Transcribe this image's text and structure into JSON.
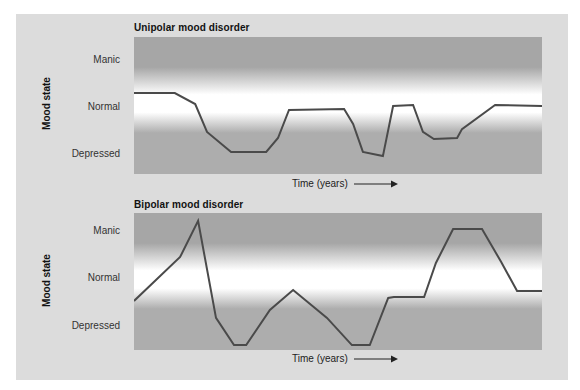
{
  "chart_data": [
    {
      "type": "line",
      "title": "Unipolar mood disorder",
      "xlabel": "Time (years)",
      "ylabel": "Mood state",
      "y_categories": [
        "Manic",
        "Normal",
        "Depressed"
      ],
      "legend": null,
      "grid": false,
      "note": "Schematic mood trace; y values normalized 0 (bottom of plot/Depressed band) to 1 (top of plot/Manic band); x normalized 0-1 across time axis",
      "series": [
        {
          "name": "Mood",
          "points": [
            [
              0.0,
              0.591
            ],
            [
              0.1,
              0.591
            ],
            [
              0.15,
              0.511
            ],
            [
              0.179,
              0.307
            ],
            [
              0.238,
              0.161
            ],
            [
              0.324,
              0.161
            ],
            [
              0.353,
              0.263
            ],
            [
              0.38,
              0.467
            ],
            [
              0.515,
              0.474
            ],
            [
              0.537,
              0.365
            ],
            [
              0.561,
              0.161
            ],
            [
              0.61,
              0.131
            ],
            [
              0.635,
              0.496
            ],
            [
              0.684,
              0.504
            ],
            [
              0.708,
              0.307
            ],
            [
              0.735,
              0.255
            ],
            [
              0.792,
              0.263
            ],
            [
              0.804,
              0.328
            ],
            [
              0.885,
              0.504
            ],
            [
              1.0,
              0.496
            ]
          ]
        }
      ]
    },
    {
      "type": "line",
      "title": "Bipolar mood disorder",
      "xlabel": "Time (years)",
      "ylabel": "Mood state",
      "y_categories": [
        "Manic",
        "Normal",
        "Depressed"
      ],
      "legend": null,
      "grid": false,
      "note": "Schematic mood trace; y values normalized 0 (bottom) to 1 (top); x normalized 0-1",
      "series": [
        {
          "name": "Mood",
          "points": [
            [
              0.0,
              0.358
            ],
            [
              0.113,
              0.679
            ],
            [
              0.157,
              0.942
            ],
            [
              0.201,
              0.234
            ],
            [
              0.245,
              0.036
            ],
            [
              0.275,
              0.036
            ],
            [
              0.333,
              0.292
            ],
            [
              0.39,
              0.438
            ],
            [
              0.473,
              0.234
            ],
            [
              0.534,
              0.036
            ],
            [
              0.578,
              0.036
            ],
            [
              0.623,
              0.38
            ],
            [
              0.637,
              0.387
            ],
            [
              0.711,
              0.387
            ],
            [
              0.74,
              0.635
            ],
            [
              0.782,
              0.883
            ],
            [
              0.853,
              0.883
            ],
            [
              0.9,
              0.642
            ],
            [
              0.939,
              0.431
            ],
            [
              1.0,
              0.431
            ]
          ]
        }
      ]
    }
  ],
  "charts": {
    "unipolar": {
      "title": "Unipolar mood disorder",
      "ylabel": "Mood state",
      "ticks": {
        "manic": "Manic",
        "normal": "Normal",
        "depressed": "Depressed"
      },
      "xlabel": "Time (years)"
    },
    "bipolar": {
      "title": "Bipolar mood disorder",
      "ylabel": "Mood state",
      "ticks": {
        "manic": "Manic",
        "normal": "Normal",
        "depressed": "Depressed"
      },
      "xlabel": "Time (years)"
    }
  },
  "colors": {
    "panel_bg": "#dcdcdc",
    "band_gray_top": "#a6a6a6",
    "band_gray_bottom": "#adadad",
    "band_white": "#ffffff",
    "line": "#4a4a4a"
  }
}
